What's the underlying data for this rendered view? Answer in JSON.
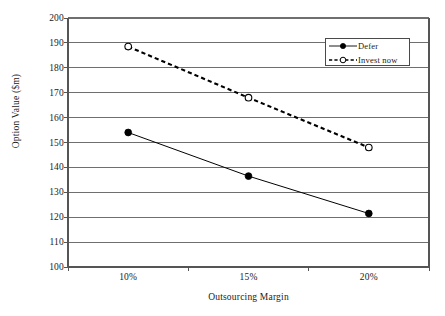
{
  "chart_data": {
    "type": "line",
    "title": "",
    "xlabel": "Outsourcing Margin",
    "ylabel": "Option Value ($m)",
    "categories": [
      "10%",
      "15%",
      "20%"
    ],
    "ylim": [
      100,
      200
    ],
    "ytick_labels": [
      "200",
      "190",
      "180",
      "170",
      "160",
      "150",
      "140",
      "130",
      "120",
      "110",
      "100"
    ],
    "ytick_values": [
      200,
      190,
      180,
      170,
      160,
      150,
      140,
      130,
      120,
      110,
      100
    ],
    "ystep": 10,
    "grid": "horizontal",
    "legend_position": "top-right",
    "series": [
      {
        "name": "Defer",
        "values": [
          154.0,
          136.5,
          121.5
        ],
        "line_style": "solid",
        "marker": "filled-circle",
        "color": "#000000"
      },
      {
        "name": "Invest now",
        "values": [
          188.5,
          168.0,
          148.0
        ],
        "line_style": "dashed",
        "marker": "open-circle",
        "color": "#000000"
      }
    ]
  },
  "axes": {
    "y_title": "Option Value ($m)",
    "x_title": "Outsourcing Margin"
  },
  "legend": {
    "items": [
      {
        "label": "Defer"
      },
      {
        "label": "Invest now"
      }
    ]
  },
  "colors": {
    "gridline": "#6f6f6f",
    "axis": "#555555",
    "series": "#000000",
    "background": "#ffffff"
  }
}
